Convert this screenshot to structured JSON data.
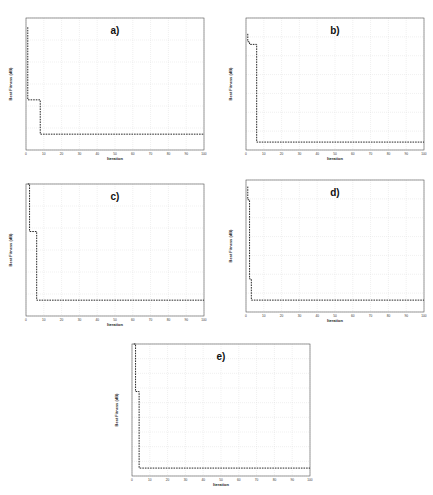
{
  "chart_data": [
    {
      "type": "line",
      "panel_label": "a)",
      "xlabel": "Iteration",
      "ylabel": "Best Fitness (dB)",
      "xlim": [
        0,
        100
      ],
      "x_ticks": [
        "0",
        "10",
        "20",
        "30",
        "40",
        "50",
        "60",
        "70",
        "80",
        "90",
        "100"
      ],
      "y_ticks": [
        "",
        "",
        "",
        "",
        "",
        "",
        ""
      ],
      "y_ticks_note": "numeric y tick values not legible at source resolution",
      "grid": true,
      "line_style": "dashed",
      "series": [
        {
          "name": "best fitness",
          "x": [
            1,
            1,
            2,
            2,
            8,
            8,
            100
          ],
          "y_norm": [
            0.93,
            0.38,
            0.38,
            0.38,
            0.38,
            0.12,
            0.12
          ]
        }
      ]
    },
    {
      "type": "line",
      "panel_label": "b)",
      "xlabel": "Iteration",
      "ylabel": "Best Fitness (dB)",
      "xlim": [
        0,
        100
      ],
      "x_ticks": [
        "0",
        "10",
        "20",
        "30",
        "40",
        "50",
        "60",
        "70",
        "80",
        "90",
        "100"
      ],
      "y_ticks": [
        "",
        "",
        "",
        "",
        "",
        "",
        "",
        ""
      ],
      "y_ticks_note": "numeric y tick values not legible at source resolution",
      "grid": true,
      "line_style": "dashed",
      "series": [
        {
          "name": "best fitness",
          "x": [
            1,
            1,
            2,
            2,
            6,
            6,
            100
          ],
          "y_norm": [
            0.88,
            0.82,
            0.82,
            0.8,
            0.8,
            0.06,
            0.06
          ]
        }
      ]
    },
    {
      "type": "line",
      "panel_label": "c)",
      "xlabel": "Iteration",
      "ylabel": "Best Fitness (dB)",
      "xlim": [
        0,
        100
      ],
      "x_ticks": [
        "0",
        "10",
        "20",
        "30",
        "40",
        "50",
        "60",
        "70",
        "80",
        "90",
        "100"
      ],
      "y_ticks": [
        "",
        "",
        "",
        "",
        "",
        "",
        ""
      ],
      "y_ticks_note": "numeric y tick values not legible at source resolution",
      "grid": true,
      "line_style": "dashed",
      "series": [
        {
          "name": "best fitness",
          "x": [
            1,
            1,
            2,
            2,
            6,
            6,
            100
          ],
          "y_norm": [
            1.0,
            1.0,
            1.0,
            0.64,
            0.64,
            0.12,
            0.12
          ]
        }
      ]
    },
    {
      "type": "line",
      "panel_label": "d)",
      "xlabel": "Iteration",
      "ylabel": "Best Fitness (dB)",
      "xlim": [
        0,
        100
      ],
      "x_ticks": [
        "0",
        "10",
        "20",
        "30",
        "40",
        "50",
        "60",
        "70",
        "80",
        "90",
        "100"
      ],
      "y_ticks": [
        "",
        "",
        "",
        "",
        "",
        "",
        "",
        ""
      ],
      "y_ticks_note": "numeric y tick values not legible at source resolution",
      "grid": true,
      "line_style": "dashed",
      "series": [
        {
          "name": "best fitness",
          "x": [
            1,
            1,
            2,
            2,
            3,
            3,
            100
          ],
          "y_norm": [
            0.95,
            0.85,
            0.85,
            0.25,
            0.25,
            0.09,
            0.09
          ]
        }
      ]
    },
    {
      "type": "line",
      "panel_label": "e)",
      "xlabel": "Iteration",
      "ylabel": "Best Fitness (dB)",
      "xlim": [
        0,
        100
      ],
      "x_ticks": [
        "0",
        "10",
        "20",
        "30",
        "40",
        "50",
        "60",
        "70",
        "80",
        "90",
        "100"
      ],
      "y_ticks": [
        "",
        "",
        "",
        "",
        "",
        "",
        "",
        "",
        "",
        ""
      ],
      "y_ticks_note": "numeric y tick values not legible at source resolution",
      "grid": true,
      "line_style": "dashed",
      "series": [
        {
          "name": "best fitness",
          "x": [
            1,
            1,
            2,
            2,
            4,
            4,
            100
          ],
          "y_norm": [
            1.0,
            1.0,
            1.0,
            0.64,
            0.64,
            0.06,
            0.06
          ]
        }
      ]
    }
  ],
  "panels": {
    "a": {
      "label": "a)",
      "xlabel": "Iteration",
      "ylabel": "Best Fitness (dB)"
    },
    "b": {
      "label": "b)",
      "xlabel": "Iteration",
      "ylabel": "Best Fitness (dB)"
    },
    "c": {
      "label": "c)",
      "xlabel": "Iteration",
      "ylabel": "Best Fitness (dB)"
    },
    "d": {
      "label": "d)",
      "xlabel": "Iteration",
      "ylabel": "Best Fitness (dB)"
    },
    "e": {
      "label": "e)",
      "xlabel": "Iteration",
      "ylabel": "Best Fitness (dB)"
    }
  }
}
